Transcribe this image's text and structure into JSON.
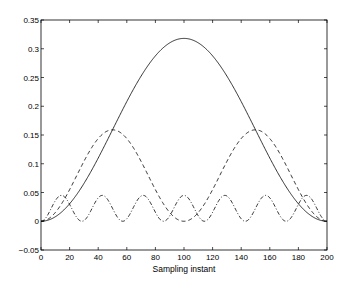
{
  "chart_data": {
    "type": "line",
    "title": "",
    "xlabel": "Sampling instant",
    "ylabel": "",
    "xlim": [
      0,
      200
    ],
    "ylim": [
      -0.05,
      0.35
    ],
    "grid": false,
    "legend": null,
    "x_ticks": [
      0,
      20,
      40,
      60,
      80,
      100,
      120,
      140,
      160,
      180,
      200
    ],
    "x_tick_labels": [
      "0",
      "20",
      "40",
      "60",
      "80",
      "100",
      "120",
      "140",
      "160",
      "180",
      "200"
    ],
    "y_ticks": [
      -0.05,
      0,
      0.05,
      0.1,
      0.15,
      0.2,
      0.25,
      0.3,
      0.35
    ],
    "y_tick_labels": [
      "-0.05",
      "0",
      "0.05",
      "0.1",
      "0.15",
      "0.2",
      "0.25",
      "0.3",
      "0.35"
    ],
    "series": [
      {
        "name": "solid",
        "style": "solid",
        "x": [
          0,
          20,
          40,
          60,
          80,
          100,
          120,
          140,
          160,
          180,
          200
        ],
        "values": [
          0,
          0.03,
          0.11,
          0.208,
          0.288,
          0.318,
          0.288,
          0.208,
          0.11,
          0.03,
          0
        ],
        "peak": {
          "x": 100,
          "y": 0.318
        }
      },
      {
        "name": "dashed",
        "style": "dashed",
        "x": [
          0,
          25,
          50,
          75,
          100,
          125,
          150,
          175,
          200
        ],
        "values": [
          0,
          0.08,
          0.159,
          0.08,
          0,
          0.08,
          0.159,
          0.08,
          0
        ],
        "peaks": [
          {
            "x": 50,
            "y": 0.159
          },
          {
            "x": 150,
            "y": 0.159
          }
        ]
      },
      {
        "name": "dash-dot",
        "style": "dashdot",
        "x": [
          0,
          14,
          29,
          43,
          57,
          71,
          86,
          100,
          114,
          129,
          143,
          157,
          171,
          186,
          200
        ],
        "values": [
          0,
          0.045,
          0,
          0.045,
          0,
          0.045,
          0,
          0.045,
          0,
          0.045,
          0,
          0.045,
          0,
          0.045,
          0
        ],
        "peak_value": 0.045,
        "lobes": 7
      }
    ]
  }
}
